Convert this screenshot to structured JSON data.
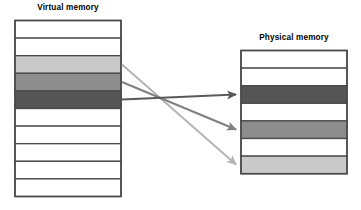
{
  "figure": {
    "kind": "diagram"
  },
  "virtual_memory": {
    "title": "Virtual memory",
    "frame_color": "#4a4a4a",
    "rows": [
      {
        "index": 1,
        "fill": "#ffffff",
        "label": ""
      },
      {
        "index": 2,
        "fill": "#ffffff",
        "label": ""
      },
      {
        "index": 3,
        "fill": "#c9c9c9",
        "label": ""
      },
      {
        "index": 4,
        "fill": "#8d8d8d",
        "label": ""
      },
      {
        "index": 5,
        "fill": "#555555",
        "label": ""
      },
      {
        "index": 6,
        "fill": "#ffffff",
        "label": ""
      },
      {
        "index": 7,
        "fill": "#ffffff",
        "label": ""
      },
      {
        "index": 8,
        "fill": "#ffffff",
        "label": ""
      },
      {
        "index": 9,
        "fill": "#ffffff",
        "label": ""
      },
      {
        "index": 10,
        "fill": "#ffffff",
        "label": ""
      }
    ]
  },
  "physical_memory": {
    "title": "Physical memory",
    "frame_color": "#4a4a4a",
    "rows": [
      {
        "index": 1,
        "fill": "#ffffff",
        "label": ""
      },
      {
        "index": 2,
        "fill": "#ffffff",
        "label": ""
      },
      {
        "index": 3,
        "fill": "#555555",
        "label": ""
      },
      {
        "index": 4,
        "fill": "#ffffff",
        "label": ""
      },
      {
        "index": 5,
        "fill": "#8d8d8d",
        "label": ""
      },
      {
        "index": 6,
        "fill": "#ffffff",
        "label": ""
      },
      {
        "index": 7,
        "fill": "#c9c9c9",
        "label": ""
      }
    ]
  },
  "mappings": [
    {
      "name": "light-gray-mapping",
      "color": "#b4b4b4",
      "from_row": 3,
      "to_row": 7
    },
    {
      "name": "medium-gray-mapping",
      "color": "#808080",
      "from_row": 4,
      "to_row": 5
    },
    {
      "name": "dark-gray-mapping",
      "color": "#5a5a5a",
      "from_row": 5,
      "to_row": 3
    }
  ],
  "colors": {
    "background": "#ffffff",
    "outline": "#4a4a4a",
    "text": "#000000",
    "light_gray": "#c9c9c9",
    "medium_gray": "#8d8d8d",
    "dark_gray": "#555555"
  }
}
